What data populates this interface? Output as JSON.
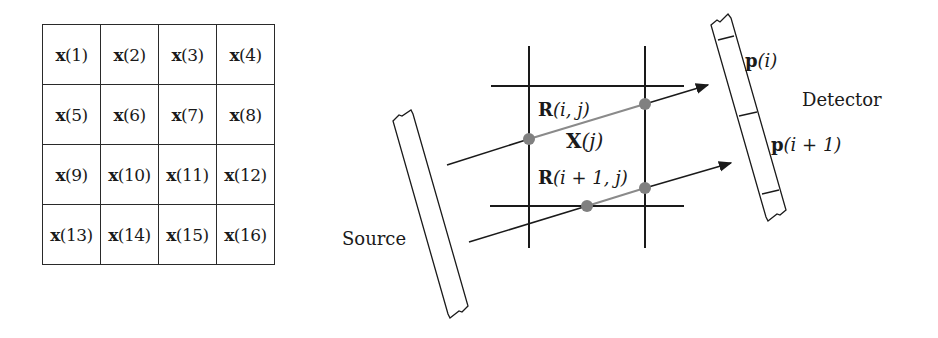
{
  "pixel_grid": {
    "rows": [
      [
        "x(1)",
        "x(2)",
        "x(3)",
        "x(4)"
      ],
      [
        "x(5)",
        "x(6)",
        "x(7)",
        "x(8)"
      ],
      [
        "x(9)",
        "x(10)",
        "x(11)",
        "x(12)"
      ],
      [
        "x(13)",
        "x(14)",
        "x(15)",
        "x(16)"
      ]
    ]
  },
  "projection_diagram": {
    "source_label": "Source",
    "detector_label": "Detector",
    "pixel_label": {
      "sym": "X",
      "arg": "(j)"
    },
    "ray_weights": [
      {
        "sym": "R",
        "arg": "(i, j)"
      },
      {
        "sym": "R",
        "arg": "(i + 1, j)"
      }
    ],
    "detector_bins": [
      {
        "sym": "p",
        "arg": "(i)"
      },
      {
        "sym": "p",
        "arg": "(i + 1)"
      }
    ],
    "colors": {
      "line": "#1a1a1a",
      "intersection_point": "#808080",
      "ray_segment_in_pixel": "#8a8a8a"
    }
  }
}
